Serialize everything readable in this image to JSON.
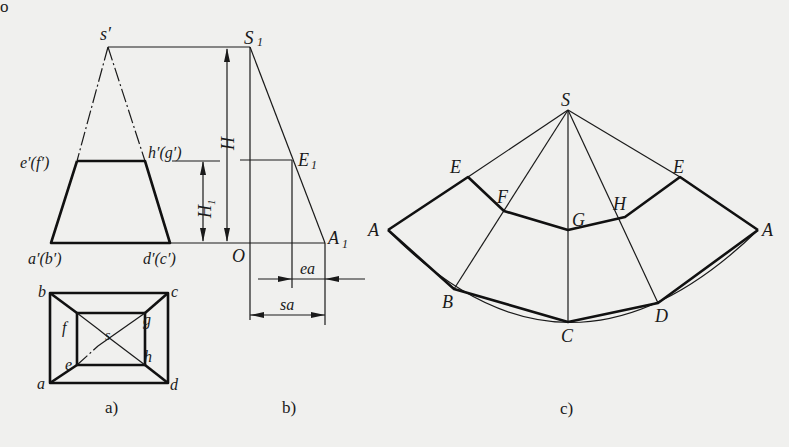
{
  "figure": {
    "corner_mark": "o",
    "panels": {
      "a": {
        "caption": "a)",
        "front_view_labels": {
          "apex": "s′",
          "cut_left": "e′(f′)",
          "cut_right": "h′(g′)",
          "base_left": "a′(b′)",
          "base_right": "d′(c′)"
        },
        "plan_view_labels": {
          "b": "b",
          "c": "c",
          "a": "a",
          "d": "d",
          "f": "f",
          "g": "g",
          "e": "e",
          "h": "h",
          "s": "s"
        }
      },
      "b": {
        "caption": "b)",
        "labels": {
          "S1": "S",
          "S1_sub": "1",
          "E1": "E",
          "E1_sub": "1",
          "A1": "A",
          "A1_sub": "1",
          "O": "O",
          "H": "H",
          "H1": "H",
          "H1_sub": "1",
          "ea": "ea",
          "sa": "sa"
        }
      },
      "c": {
        "caption": "c)",
        "labels": {
          "S": "S",
          "E_left": "E",
          "F": "F",
          "G": "G",
          "H": "H",
          "E_right": "E",
          "A_left": "A",
          "A_right": "A",
          "B": "B",
          "C": "C",
          "D": "D"
        }
      }
    }
  }
}
